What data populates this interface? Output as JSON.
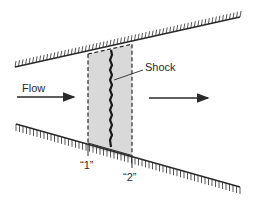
{
  "diagram": {
    "labels": {
      "flow": "Flow",
      "shock": "Shock",
      "station1": "“1”",
      "station2": "“2”"
    },
    "colors": {
      "line": "#2a2a2a",
      "control_volume_fill": "#d9d9d9",
      "background": "#ffffff"
    },
    "elements": [
      {
        "id": "upper-wall",
        "type": "hatched-wall",
        "from": [
          15,
          67
        ],
        "to": [
          240,
          17
        ],
        "hatch_side": "above"
      },
      {
        "id": "lower-wall",
        "type": "hatched-wall",
        "from": [
          16,
          124
        ],
        "to": [
          240,
          187
        ],
        "hatch_side": "below"
      },
      {
        "id": "control-volume",
        "type": "dashed-box",
        "x1": 88,
        "x2": 132
      },
      {
        "id": "shock-wave",
        "type": "jagged-line",
        "x": 111
      },
      {
        "id": "flow-arrow-in",
        "type": "arrow",
        "from": [
          17,
          97
        ],
        "to": [
          76,
          97
        ]
      },
      {
        "id": "flow-arrow-out",
        "type": "arrow",
        "from": [
          149,
          98
        ],
        "to": [
          210,
          98
        ]
      }
    ]
  }
}
